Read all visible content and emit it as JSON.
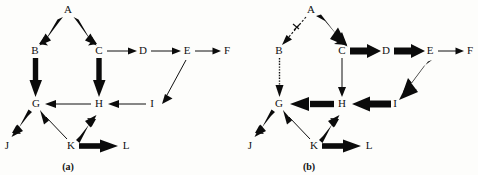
{
  "figure": {
    "title": "",
    "background_color": "#fdfdfb",
    "ink_color": "#0b0b0b",
    "width": 478,
    "height": 175
  },
  "panels": [
    {
      "id": "panel-a",
      "caption": "(a)",
      "caption_pos": {
        "x": 68,
        "y": 167
      },
      "nodes": [
        {
          "id": "A",
          "label": "A",
          "x": 68,
          "y": 10
        },
        {
          "id": "B",
          "label": "B",
          "x": 35,
          "y": 51
        },
        {
          "id": "C",
          "label": "C",
          "x": 99,
          "y": 51
        },
        {
          "id": "D",
          "label": "D",
          "x": 143,
          "y": 51
        },
        {
          "id": "E",
          "label": "E",
          "x": 187,
          "y": 51
        },
        {
          "id": "F",
          "label": "F",
          "x": 227,
          "y": 51
        },
        {
          "id": "G",
          "label": "G",
          "x": 36,
          "y": 104
        },
        {
          "id": "H",
          "label": "H",
          "x": 99,
          "y": 104
        },
        {
          "id": "I",
          "label": "I",
          "x": 152,
          "y": 104
        },
        {
          "id": "J",
          "label": "J",
          "x": 7,
          "y": 146
        },
        {
          "id": "K",
          "label": "K",
          "x": 71,
          "y": 146
        },
        {
          "id": "L",
          "label": "L",
          "x": 126,
          "y": 146
        }
      ],
      "edges": [
        {
          "from": "A",
          "to": "B",
          "style": "thick",
          "weight": 6
        },
        {
          "from": "A",
          "to": "C",
          "style": "thick",
          "weight": 6
        },
        {
          "from": "B",
          "to": "G",
          "style": "thick",
          "weight": 6
        },
        {
          "from": "C",
          "to": "D",
          "style": "thin",
          "weight": 1
        },
        {
          "from": "C",
          "to": "H",
          "style": "thick",
          "weight": 6
        },
        {
          "from": "D",
          "to": "E",
          "style": "thin",
          "weight": 1
        },
        {
          "from": "E",
          "to": "F",
          "style": "thin",
          "weight": 1
        },
        {
          "from": "E",
          "to": "I",
          "style": "thin",
          "weight": 1
        },
        {
          "from": "H",
          "to": "G",
          "style": "thin",
          "weight": 1
        },
        {
          "from": "I",
          "to": "H",
          "style": "thin",
          "weight": 1
        },
        {
          "from": "G",
          "to": "J",
          "style": "thick",
          "weight": 6
        },
        {
          "from": "K",
          "to": "G",
          "style": "thin",
          "weight": 1
        },
        {
          "from": "K",
          "to": "H",
          "style": "thick",
          "weight": 6
        },
        {
          "from": "K",
          "to": "L",
          "style": "thick",
          "weight": 6
        }
      ]
    },
    {
      "id": "panel-b",
      "caption": "(b)",
      "caption_pos": {
        "x": 309,
        "y": 167
      },
      "nodes": [
        {
          "id": "A",
          "label": "A",
          "x": 311,
          "y": 10
        },
        {
          "id": "B",
          "label": "B",
          "x": 279,
          "y": 51
        },
        {
          "id": "C",
          "label": "C",
          "x": 342,
          "y": 51
        },
        {
          "id": "D",
          "label": "D",
          "x": 386,
          "y": 51
        },
        {
          "id": "E",
          "label": "E",
          "x": 430,
          "y": 51
        },
        {
          "id": "F",
          "label": "F",
          "x": 470,
          "y": 51
        },
        {
          "id": "G",
          "label": "G",
          "x": 279,
          "y": 104
        },
        {
          "id": "H",
          "label": "H",
          "x": 342,
          "y": 104
        },
        {
          "id": "I",
          "label": "I",
          "x": 395,
          "y": 104
        },
        {
          "id": "J",
          "label": "J",
          "x": 250,
          "y": 146
        },
        {
          "id": "K",
          "label": "K",
          "x": 314,
          "y": 146
        },
        {
          "id": "L",
          "label": "L",
          "x": 369,
          "y": 146
        }
      ],
      "edges": [
        {
          "from": "A",
          "to": "B",
          "style": "dashed-crossed",
          "weight": 0
        },
        {
          "from": "A",
          "to": "C",
          "style": "very-thick",
          "weight": 9
        },
        {
          "from": "B",
          "to": "G",
          "style": "dotted",
          "weight": 0
        },
        {
          "from": "C",
          "to": "D",
          "style": "thick",
          "weight": 6
        },
        {
          "from": "C",
          "to": "H",
          "style": "thin",
          "weight": 1
        },
        {
          "from": "D",
          "to": "E",
          "style": "thick",
          "weight": 6
        },
        {
          "from": "E",
          "to": "F",
          "style": "thin",
          "weight": 1
        },
        {
          "from": "E",
          "to": "I",
          "style": "very-thick",
          "weight": 9
        },
        {
          "from": "H",
          "to": "G",
          "style": "thick",
          "weight": 6
        },
        {
          "from": "I",
          "to": "H",
          "style": "thick",
          "weight": 7
        },
        {
          "from": "G",
          "to": "J",
          "style": "thick",
          "weight": 6
        },
        {
          "from": "K",
          "to": "G",
          "style": "thin",
          "weight": 1
        },
        {
          "from": "K",
          "to": "H",
          "style": "thick",
          "weight": 6
        },
        {
          "from": "K",
          "to": "L",
          "style": "thick",
          "weight": 6
        }
      ]
    }
  ]
}
